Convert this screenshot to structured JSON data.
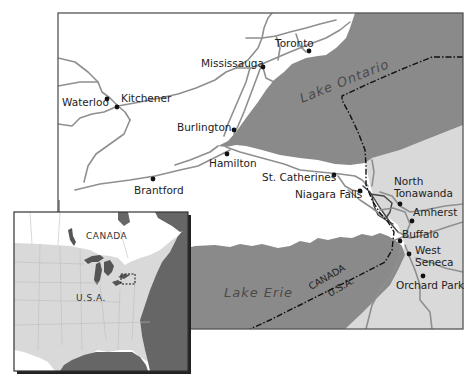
{
  "map": {
    "title": "Niagara Region / Golden Horseshoe",
    "colors": {
      "canada_land": "#ffffff",
      "usa_land": "#d9d9d9",
      "water": "#8a8a8a",
      "roads": "#8f8f8f",
      "border_line": "#111111",
      "frame": "#555555"
    },
    "water_bodies": [
      {
        "id": "lake-ontario",
        "label": "Lake Ontario"
      },
      {
        "id": "lake-erie",
        "label": "Lake Erie"
      }
    ],
    "border": {
      "label_north": "CANADA",
      "label_south": "U.S.A."
    },
    "cities": [
      {
        "name": "Toronto",
        "country": "CANADA"
      },
      {
        "name": "Mississauga",
        "country": "CANADA"
      },
      {
        "name": "Kitchener",
        "country": "CANADA"
      },
      {
        "name": "Waterloo",
        "country": "CANADA"
      },
      {
        "name": "Burlington",
        "country": "CANADA"
      },
      {
        "name": "Hamilton",
        "country": "CANADA"
      },
      {
        "name": "Brantford",
        "country": "CANADA"
      },
      {
        "name": "St. Catherines",
        "country": "CANADA"
      },
      {
        "name": "Niagara Falls",
        "country": "CANADA"
      },
      {
        "name": "North Tonawanda",
        "country": "U.S.A."
      },
      {
        "name": "Amherst",
        "country": "U.S.A."
      },
      {
        "name": "Buffalo",
        "country": "U.S.A."
      },
      {
        "name": "West Seneca",
        "country": "U.S.A."
      },
      {
        "name": "Orchard Park",
        "country": "U.S.A."
      }
    ],
    "labels": {
      "north_tonawanda_line1": "North",
      "north_tonawanda_line2": "Tonawanda",
      "west_seneca_line1": "West",
      "west_seneca_line2": "Seneca"
    }
  },
  "inset": {
    "label_canada": "CANADA",
    "label_usa": "U.S.A.",
    "highlight": "dashed box marking the Niagara region"
  }
}
